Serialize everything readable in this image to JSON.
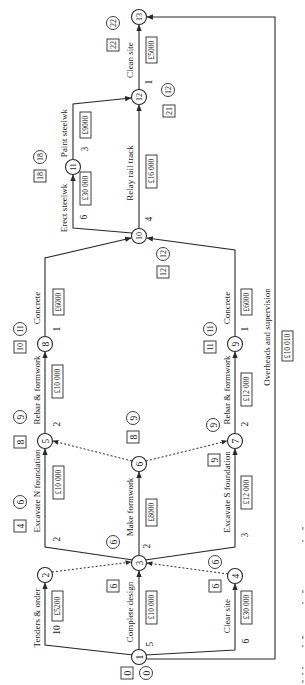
{
  "diagram": {
    "type": "activity-on-arrow network (rotated 90° counter-clockwise)",
    "nodes": [
      {
        "id": "1",
        "early": "0",
        "late": "0"
      },
      {
        "id": "2",
        "early": "4",
        "late": "6"
      },
      {
        "id": "3",
        "early": "6",
        "late": "6"
      },
      {
        "id": "4",
        "early": "6",
        "late": "6"
      },
      {
        "id": "5",
        "early": "8",
        "late": "9"
      },
      {
        "id": "6",
        "early": "8",
        "late": "9"
      },
      {
        "id": "7",
        "early": "9",
        "late": "9"
      },
      {
        "id": "8",
        "early": "10",
        "late": "11"
      },
      {
        "id": "9",
        "early": "11",
        "late": "11"
      },
      {
        "id": "10",
        "early": "12",
        "late": "12"
      },
      {
        "id": "11",
        "early": "18",
        "late": "18"
      },
      {
        "id": "12",
        "early": "21",
        "late": "12"
      },
      {
        "id": "13",
        "early": "22",
        "late": "22"
      }
    ],
    "activities": [
      {
        "from": "1",
        "to": "2",
        "name": "Tenders & order",
        "duration": "10",
        "cost": "£5200"
      },
      {
        "from": "1",
        "to": "3",
        "name": "Complete design",
        "duration": "5",
        "cost": "£10 000"
      },
      {
        "from": "1",
        "to": "4",
        "name": "Clear site",
        "duration": "6",
        "cost": "£30 000"
      },
      {
        "from": "3",
        "to": "5",
        "name": "Excavate N foundation",
        "duration": "2",
        "cost": "£10 000"
      },
      {
        "from": "3",
        "to": "6",
        "name": "Make formwork",
        "duration": "2",
        "cost": "£8000"
      },
      {
        "from": "3",
        "to": "7",
        "name": "Excavate S foundation",
        "duration": "3",
        "cost": "£12 000"
      },
      {
        "from": "5",
        "to": "8",
        "name": "Rebar & formwork",
        "duration": "2",
        "cost": "£10 000"
      },
      {
        "from": "7",
        "to": "9",
        "name": "Rebar & formwork",
        "duration": "2",
        "cost": "£12 000"
      },
      {
        "from": "8",
        "to": "10",
        "name": "Concrete",
        "duration": "1",
        "cost": "£6000"
      },
      {
        "from": "9",
        "to": "10",
        "name": "Concrete",
        "duration": "1",
        "cost": "£6000"
      },
      {
        "from": "10",
        "to": "11",
        "name": "Erect steelwk",
        "duration": "6",
        "cost": "£30 000"
      },
      {
        "from": "11",
        "to": "12",
        "name": "Paint steelwk",
        "duration": "3",
        "cost": "£9000"
      },
      {
        "from": "10",
        "to": "12",
        "name": "Relay rail track",
        "duration": "4",
        "cost": "£16 000"
      },
      {
        "from": "12",
        "to": "13",
        "name": "Clean site",
        "duration": "1",
        "cost": "£5000"
      },
      {
        "from": "1",
        "to": "13",
        "name": "Overheads and supervision",
        "duration": "",
        "cost": "£10 010"
      }
    ],
    "dummies": [
      {
        "from": "2",
        "to": "3"
      },
      {
        "from": "4",
        "to": "3"
      },
      {
        "from": "6",
        "to": "5"
      },
      {
        "from": "6",
        "to": "7"
      }
    ]
  }
}
